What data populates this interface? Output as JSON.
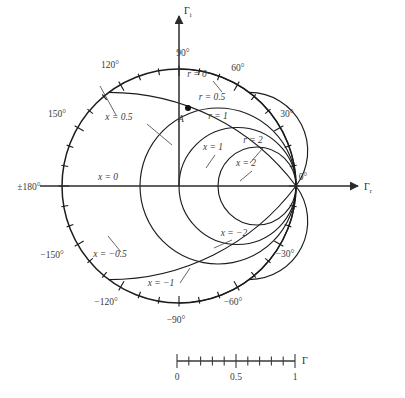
{
  "figure": {
    "axes": {
      "real_axis_label": "Γ",
      "real_axis_sub": "r",
      "imag_axis_label": "Γ",
      "imag_axis_sub": "i"
    },
    "geometry": {
      "center_x": 179,
      "center_y": 186,
      "radius": 117
    },
    "angle_labels": [
      {
        "text": "90°",
        "angle": 90,
        "x": 183,
        "y": 56
      },
      {
        "text": "60°",
        "angle": 60,
        "x": 238,
        "y": 71
      },
      {
        "text": "30°",
        "angle": 30,
        "x": 287,
        "y": 117
      },
      {
        "text": "0°",
        "angle": 0,
        "x": 303,
        "y": 180
      },
      {
        "text": "−30°",
        "angle": -30,
        "x": 285,
        "y": 257
      },
      {
        "text": "−60°",
        "angle": -60,
        "x": 233,
        "y": 305
      },
      {
        "text": "−90°",
        "angle": -90,
        "x": 176,
        "y": 323
      },
      {
        "text": "−120°",
        "angle": -120,
        "x": 106,
        "y": 305
      },
      {
        "text": "−150°",
        "angle": -150,
        "x": 52,
        "y": 258
      },
      {
        "text": "±180°",
        "angle": 180,
        "x": 29,
        "y": 190
      },
      {
        "text": "150°",
        "angle": 150,
        "x": 57,
        "y": 117
      },
      {
        "text": "120°",
        "angle": 120,
        "x": 110,
        "y": 68
      }
    ],
    "tick_interval_deg": 10,
    "resistance_circles": [
      {
        "label": "r = 0",
        "r": 0,
        "label_x": 197,
        "label_y": 77
      },
      {
        "label": "r = 0.5",
        "r": 0.5,
        "label_x": 212,
        "label_y": 100
      },
      {
        "label": "r = 1",
        "r": 1,
        "label_x": 218,
        "label_y": 119
      },
      {
        "label": "r = 2",
        "r": 2,
        "label_x": 253,
        "label_y": 143
      }
    ],
    "reactance_arcs": [
      {
        "label": "x = 0.5",
        "x": 0.5,
        "label_x": 119,
        "label_y": 120
      },
      {
        "label": "x = 1",
        "x": 1,
        "label_x": 213,
        "label_y": 150
      },
      {
        "label": "x = 2",
        "x": 2,
        "label_x": 246,
        "label_y": 166
      },
      {
        "label": "x = 0",
        "x": 0,
        "label_x": 108,
        "label_y": 180
      },
      {
        "label": "x = −2",
        "x": -2,
        "label_x": 234,
        "label_y": 236
      },
      {
        "label": "x = −0.5",
        "x": -0.5,
        "label_x": 110,
        "label_y": 257
      },
      {
        "label": "x = −1",
        "x": -1,
        "label_x": 161,
        "label_y": 286
      }
    ],
    "marked_point": {
      "label": "A",
      "x": 188,
      "y": 108,
      "label_x": 181,
      "label_y": 122
    },
    "scale_bar": {
      "axis_label": "Γ",
      "x_start": 177,
      "x_end": 295,
      "y": 361,
      "divisions": 10,
      "ticks": [
        {
          "value": "0",
          "pos": 0.0,
          "major": true
        },
        {
          "value": "",
          "pos": 0.1,
          "major": false
        },
        {
          "value": "",
          "pos": 0.2,
          "major": false
        },
        {
          "value": "",
          "pos": 0.3,
          "major": false
        },
        {
          "value": "",
          "pos": 0.4,
          "major": false
        },
        {
          "value": "0.5",
          "pos": 0.5,
          "major": true
        },
        {
          "value": "",
          "pos": 0.6,
          "major": false
        },
        {
          "value": "",
          "pos": 0.7,
          "major": false
        },
        {
          "value": "",
          "pos": 0.8,
          "major": false
        },
        {
          "value": "",
          "pos": 0.9,
          "major": false
        },
        {
          "value": "1",
          "pos": 1.0,
          "major": true
        }
      ]
    },
    "colors": {
      "curve": "#1c1c1c",
      "axis": "#2b2b2b",
      "label": "#3a3a3a",
      "background": "#ffffff"
    }
  },
  "chart_data": {
    "type": "smith-chart",
    "xlabel": "Γr",
    "ylabel": "Γi",
    "xlim": [
      -1,
      1
    ],
    "ylim": [
      -1,
      1
    ],
    "grid": true,
    "legend": "none",
    "unit_circle_radius": 1,
    "resistance_circle_values": [
      0,
      0.5,
      1,
      2
    ],
    "reactance_arc_values": [
      0.5,
      1,
      2,
      0,
      -0.5,
      -1,
      -2
    ],
    "angle_tick_labels_deg": [
      90,
      60,
      30,
      0,
      -30,
      -60,
      -90,
      -120,
      -150,
      180,
      150,
      120
    ],
    "minor_angle_tick_interval_deg": 10,
    "annotations": [
      {
        "label": "A",
        "gamma_r": 0.08,
        "gamma_i": 0.67
      }
    ],
    "magnitude_scale": {
      "label": "Γ",
      "min": 0,
      "max": 1,
      "major_ticks": [
        0,
        0.5,
        1
      ],
      "minor_tick_step": 0.1
    }
  }
}
